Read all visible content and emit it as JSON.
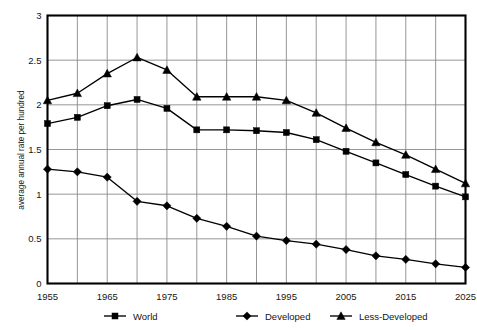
{
  "chart_data": {
    "type": "line",
    "title": "",
    "xlabel": "",
    "ylabel": "average annual rate per hundred",
    "xlim": [
      1955,
      2025
    ],
    "ylim": [
      0,
      3
    ],
    "ytick_step": 0.5,
    "xtick_step": 5,
    "grid": true,
    "legend_position": "bottom",
    "x": [
      1955,
      1960,
      1965,
      1970,
      1975,
      1980,
      1985,
      1990,
      1995,
      2000,
      2005,
      2010,
      2015,
      2020,
      2025
    ],
    "x_tick_labels": [
      "1955",
      "1965",
      "1975",
      "1985",
      "1995",
      "2005",
      "2015",
      "2025"
    ],
    "x_tick_values": [
      1955,
      1965,
      1975,
      1985,
      1995,
      2005,
      2015,
      2025
    ],
    "y_tick_labels": [
      "0",
      "0.5",
      "1",
      "1.5",
      "2",
      "2.5",
      "3"
    ],
    "y_tick_values": [
      0,
      0.5,
      1,
      1.5,
      2,
      2.5,
      3
    ],
    "series": [
      {
        "name": "World",
        "marker": "square",
        "values": [
          1.79,
          1.86,
          1.99,
          2.06,
          1.96,
          1.72,
          1.72,
          1.71,
          1.69,
          1.61,
          1.48,
          1.35,
          1.22,
          1.09,
          0.97
        ]
      },
      {
        "name": "Developed",
        "marker": "diamond",
        "values": [
          1.28,
          1.25,
          1.19,
          0.92,
          0.87,
          0.73,
          0.64,
          0.53,
          0.48,
          0.44,
          0.38,
          0.31,
          0.27,
          0.22,
          0.18
        ]
      },
      {
        "name": "Less-Developed",
        "marker": "triangle",
        "values": [
          2.05,
          2.13,
          2.35,
          2.53,
          2.39,
          2.09,
          2.09,
          2.09,
          2.05,
          1.91,
          1.74,
          1.58,
          1.44,
          1.28,
          1.12
        ]
      }
    ]
  },
  "legend": {
    "items": [
      {
        "label": "World"
      },
      {
        "label": "Developed"
      },
      {
        "label": "Less-Developed"
      }
    ]
  },
  "axes": {
    "y_title": "average annual rate per hundred"
  }
}
